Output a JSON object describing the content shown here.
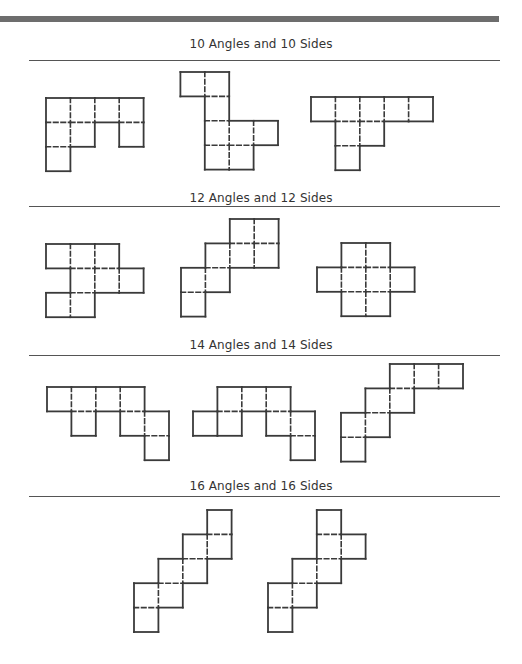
{
  "colors": {
    "line": "#3a3a3a",
    "bar": "#6d6d6d"
  },
  "cell_size": 24.4,
  "sections": [
    {
      "title": "10 Angles and 10 Sides",
      "title_y": 37,
      "divider_y": 60
    },
    {
      "title": "12 Angles and 12 Sides",
      "title_y": 191,
      "divider_y": 206
    },
    {
      "title": "14 Angles and 14 Sides",
      "title_y": 338,
      "divider_y": 355
    },
    {
      "title": "16 Angles and 16 Sides",
      "title_y": 479,
      "divider_y": 496
    }
  ],
  "shapes": [
    {
      "name": "net-10-a",
      "section": 0,
      "origin": [
        46,
        98
      ],
      "cells": [
        [
          0,
          0
        ],
        [
          0,
          1
        ],
        [
          0,
          2
        ],
        [
          0,
          3
        ],
        [
          1,
          0
        ],
        [
          1,
          1
        ],
        [
          1,
          3
        ],
        [
          2,
          0
        ]
      ],
      "cuts": []
    },
    {
      "name": "net-10-b",
      "section": 0,
      "origin": [
        156,
        72
      ],
      "cells": [
        [
          0,
          1
        ],
        [
          0,
          2
        ],
        [
          1,
          2
        ],
        [
          2,
          2
        ],
        [
          2,
          3
        ],
        [
          2,
          4
        ],
        [
          3,
          2
        ],
        [
          3,
          3
        ]
      ],
      "cuts": []
    },
    {
      "name": "net-10-c",
      "section": 0,
      "origin": [
        311,
        97
      ],
      "cells": [
        [
          0,
          0
        ],
        [
          0,
          1
        ],
        [
          0,
          2
        ],
        [
          0,
          3
        ],
        [
          0,
          4
        ],
        [
          1,
          1
        ],
        [
          1,
          2
        ],
        [
          2,
          1
        ]
      ],
      "cuts": []
    },
    {
      "name": "net-12-a",
      "section": 1,
      "origin": [
        46,
        244
      ],
      "cells": [
        [
          0,
          0
        ],
        [
          0,
          1
        ],
        [
          0,
          2
        ],
        [
          1,
          1
        ],
        [
          1,
          2
        ],
        [
          1,
          3
        ],
        [
          2,
          0
        ],
        [
          2,
          1
        ]
      ],
      "cuts": []
    },
    {
      "name": "net-12-b",
      "section": 1,
      "origin": [
        181,
        219
      ],
      "cells": [
        [
          0,
          2
        ],
        [
          0,
          3
        ],
        [
          1,
          1
        ],
        [
          1,
          2
        ],
        [
          1,
          3
        ],
        [
          2,
          0
        ],
        [
          2,
          1
        ],
        [
          3,
          0
        ]
      ],
      "cuts": []
    },
    {
      "name": "net-12-c",
      "section": 1,
      "origin": [
        317,
        243
      ],
      "cells": [
        [
          0,
          1
        ],
        [
          0,
          2
        ],
        [
          1,
          0
        ],
        [
          1,
          1
        ],
        [
          1,
          2
        ],
        [
          1,
          3
        ],
        [
          2,
          1
        ],
        [
          2,
          2
        ]
      ],
      "cuts": []
    },
    {
      "name": "net-14-a",
      "section": 2,
      "origin": [
        47,
        387
      ],
      "cells": [
        [
          0,
          0
        ],
        [
          0,
          1
        ],
        [
          0,
          2
        ],
        [
          0,
          3
        ],
        [
          1,
          1
        ],
        [
          1,
          3
        ],
        [
          1,
          4
        ],
        [
          2,
          4
        ]
      ],
      "cuts": []
    },
    {
      "name": "net-14-b",
      "section": 2,
      "origin": [
        193,
        387
      ],
      "cells": [
        [
          0,
          1
        ],
        [
          0,
          2
        ],
        [
          0,
          3
        ],
        [
          1,
          0
        ],
        [
          1,
          1
        ],
        [
          1,
          3
        ],
        [
          1,
          4
        ],
        [
          2,
          4
        ]
      ],
      "cuts": [
        [
          [
            1,
            0
          ],
          [
            1,
            1
          ]
        ]
      ]
    },
    {
      "name": "net-14-c",
      "section": 2,
      "origin": [
        341,
        364
      ],
      "cells": [
        [
          0,
          2
        ],
        [
          0,
          3
        ],
        [
          0,
          4
        ],
        [
          1,
          1
        ],
        [
          1,
          2
        ],
        [
          2,
          0
        ],
        [
          2,
          1
        ],
        [
          3,
          0
        ]
      ],
      "cuts": []
    },
    {
      "name": "net-16-a",
      "section": 3,
      "origin": [
        134,
        510
      ],
      "cells": [
        [
          0,
          3
        ],
        [
          1,
          2
        ],
        [
          1,
          3
        ],
        [
          2,
          1
        ],
        [
          2,
          2
        ],
        [
          3,
          0
        ],
        [
          3,
          1
        ],
        [
          4,
          0
        ]
      ],
      "cuts": []
    },
    {
      "name": "net-16-b",
      "section": 3,
      "origin": [
        268,
        510
      ],
      "cells": [
        [
          0,
          2
        ],
        [
          1,
          2
        ],
        [
          1,
          3
        ],
        [
          2,
          1
        ],
        [
          2,
          2
        ],
        [
          3,
          0
        ],
        [
          3,
          1
        ],
        [
          4,
          0
        ]
      ],
      "cuts": []
    }
  ]
}
